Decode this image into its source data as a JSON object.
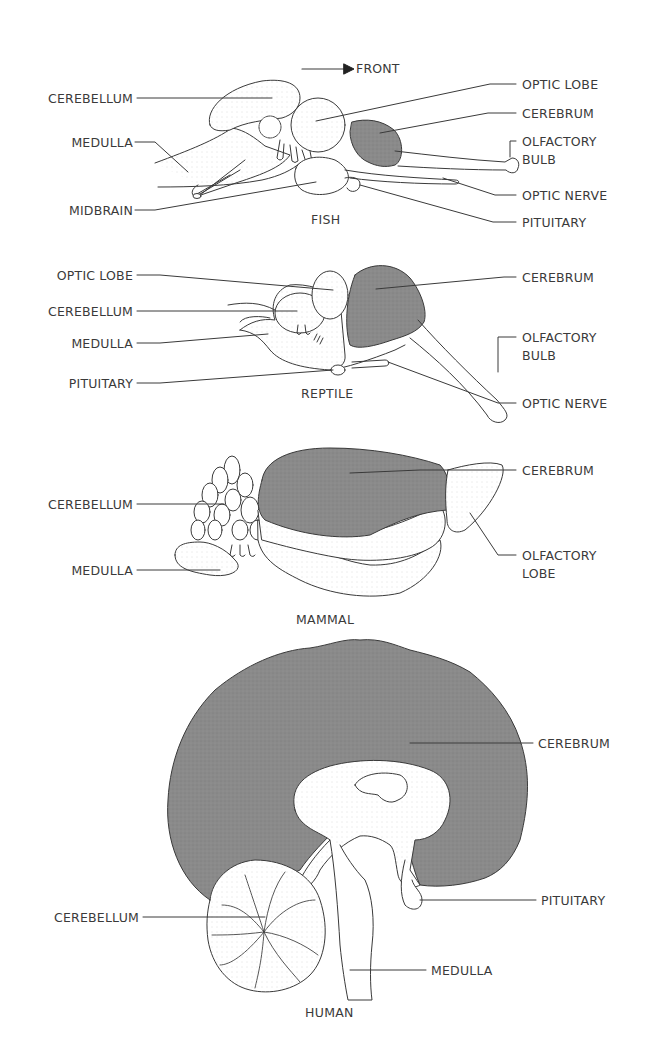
{
  "orientation": {
    "arrow_label": "FRONT",
    "icon": "arrow-right-icon"
  },
  "colors": {
    "cerebrum_fill": "#8a8a8a",
    "outline": "#3a3a3a",
    "background": "#ffffff"
  },
  "panels": [
    {
      "caption": "FISH",
      "labels": [
        {
          "text": "CEREBELLUM",
          "side": "left"
        },
        {
          "text": "MEDULLA",
          "side": "left"
        },
        {
          "text": "MIDBRAIN",
          "side": "left"
        },
        {
          "text": "OPTIC LOBE",
          "side": "right"
        },
        {
          "text": "CEREBRUM",
          "side": "right"
        },
        {
          "text": "OLFACTORY",
          "side": "right"
        },
        {
          "text": "BULB",
          "side": "right"
        },
        {
          "text": "OPTIC NERVE",
          "side": "right"
        },
        {
          "text": "PITUITARY",
          "side": "right"
        }
      ]
    },
    {
      "caption": "REPTILE",
      "labels": [
        {
          "text": "OPTIC LOBE",
          "side": "left"
        },
        {
          "text": "CEREBELLUM",
          "side": "left"
        },
        {
          "text": "MEDULLA",
          "side": "left"
        },
        {
          "text": "PITUITARY",
          "side": "left"
        },
        {
          "text": "CEREBRUM",
          "side": "right"
        },
        {
          "text": "OLFACTORY",
          "side": "right"
        },
        {
          "text": "BULB",
          "side": "right"
        },
        {
          "text": "OPTIC NERVE",
          "side": "right"
        }
      ]
    },
    {
      "caption": "MAMMAL",
      "labels": [
        {
          "text": "CEREBELLUM",
          "side": "left"
        },
        {
          "text": "MEDULLA",
          "side": "left"
        },
        {
          "text": "CEREBRUM",
          "side": "right"
        },
        {
          "text": "OLFACTORY",
          "side": "right"
        },
        {
          "text": "LOBE",
          "side": "right"
        }
      ]
    },
    {
      "caption": "HUMAN",
      "labels": [
        {
          "text": "CEREBELLUM",
          "side": "left"
        },
        {
          "text": "CEREBRUM",
          "side": "right"
        },
        {
          "text": "PITUITARY",
          "side": "right"
        },
        {
          "text": "MEDULLA",
          "side": "right"
        }
      ]
    }
  ]
}
